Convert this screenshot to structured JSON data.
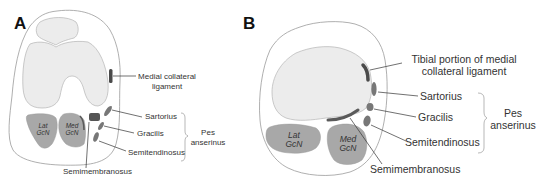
{
  "panels": [
    {
      "id": "A",
      "letter": "A",
      "labels": {
        "mcl_line1": "Medial collateral",
        "mcl_line2": "ligament",
        "sartorius": "Sartorius",
        "gracilis": "Gracilis",
        "semitendinosus": "Semitendinosus",
        "semimembranosus": "Semimembranosus",
        "pes_line1": "Pes",
        "pes_line2": "anserinus",
        "lat_gcn_line1": "Lat",
        "lat_gcn_line2": "GcN",
        "med_gcn_line1": "Med",
        "med_gcn_line2": "GcN"
      }
    },
    {
      "id": "B",
      "letter": "B",
      "labels": {
        "mcl_line1": "Tibial portion of medial",
        "mcl_line2": "collateral ligament",
        "sartorius": "Sartorius",
        "gracilis": "Gracilis",
        "semitendinosus": "Semitendinosus",
        "semimembranosus": "Semimembranosus",
        "pes_line1": "Pes",
        "pes_line2": "anserinus",
        "lat_gcn_line1": "Lat",
        "lat_gcn_line2": "GcN",
        "med_gcn_line1": "Med",
        "med_gcn_line2": "GcN"
      }
    }
  ],
  "colors": {
    "outline": "#9a9a9a",
    "bone_fill": "#ececec",
    "muscle_fill": "#a8a8a8",
    "tendon_fill": "#6e6e6e",
    "ligament_fill": "#4a4a4a",
    "line": "#333333"
  }
}
